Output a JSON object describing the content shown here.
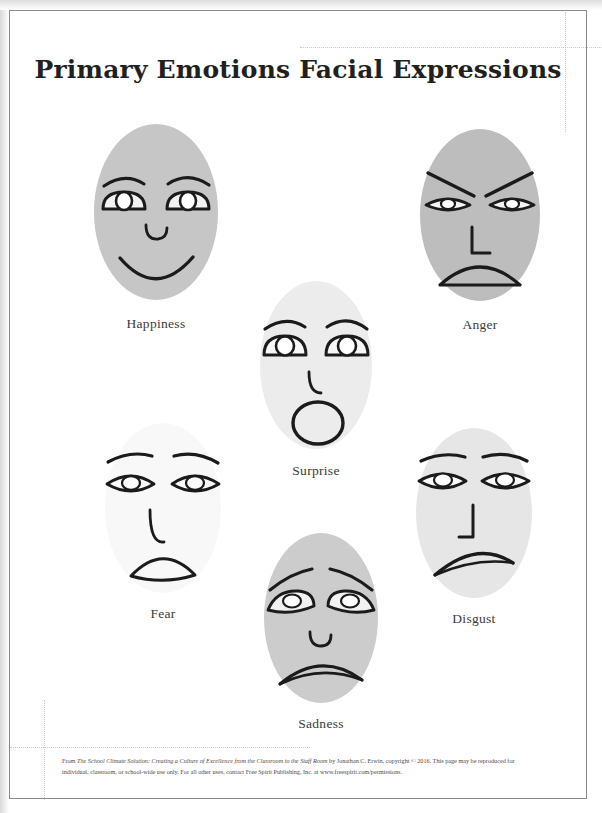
{
  "document": {
    "title": "Primary Emotions Facial Expressions",
    "footer_text": "From The School Climate Solution: Creating a Culture of Excellence from the Classroom to the Staff Room by Jonathan C. Erwin, copyright © 2016. This page may be reproduced for individual, classroom, or school-wide use only. For all other uses, contact Free Spirit Publishing, Inc. at www.freespirit.com/permissions.",
    "footer_parts": {
      "lead": "From ",
      "book_title_italic": "The School Climate Solution: Creating a Culture of Excellence from the Classroom to the Staff Room",
      "rest": " by Jonathan C. Erwin, copyright © 2016. This page may be reproduced for individual, classroom, or school-wide use only. For all other uses, contact Free Spirit Publishing, Inc. at www.freespirit.com/permissions."
    }
  },
  "colors": {
    "ink": "#221f1f",
    "label": "#3a3a3a",
    "frame": "#8b8b8b",
    "guide": "#c9c9c9",
    "face_fill_medium": "#c4c4c4",
    "face_fill_light": "#dcdcdc",
    "face_fill_pale": "#ededed",
    "face_fill_faint": "#f7f7f7",
    "page": "#ffffff"
  },
  "faces": [
    {
      "id": "happiness",
      "label": "Happiness",
      "fill": "#c6c6c6",
      "brow": "arched-raised",
      "eyes": "half-dome-open",
      "nose": "small-curve",
      "mouth": "wide-smile"
    },
    {
      "id": "anger",
      "label": "Anger",
      "fill": "#bdbdbd",
      "brow": "slanted-down-inward",
      "eyes": "narrow-squint",
      "nose": "angular-L",
      "mouth": "downturned-flat-bottom"
    },
    {
      "id": "surprise",
      "label": "Surprise",
      "fill": "#ececec",
      "brow": "high-arched",
      "eyes": "wide-round",
      "nose": "hook",
      "mouth": "open-circle"
    },
    {
      "id": "fear",
      "label": "Fear",
      "fill": "#f8f8f8",
      "brow": "raised-slanted-out",
      "eyes": "wide-lens",
      "nose": "long-hook",
      "mouth": "small-arched-open"
    },
    {
      "id": "sadness",
      "label": "Sadness",
      "fill": "#cccccc",
      "brow": "inner-raised-droop",
      "eyes": "droopy",
      "nose": "small-curve",
      "mouth": "downturned-frown"
    },
    {
      "id": "disgust",
      "label": "Disgust",
      "fill": "#e6e6e6",
      "brow": "straight-slight-angle",
      "eyes": "narrow-lens",
      "nose": "angular-J",
      "mouth": "downturned-wavy"
    }
  ]
}
